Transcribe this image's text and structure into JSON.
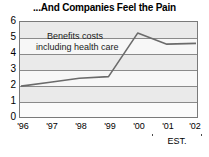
{
  "chart_data": {
    "type": "line",
    "title": "...And Companies Feel the Pain",
    "xlabel": "",
    "ylabel": "",
    "categories": [
      "'96",
      "'97",
      "'98",
      "'99",
      "'00",
      "'01",
      "'02"
    ],
    "series": [
      {
        "name": "Benefits costs including health care",
        "values": [
          1.95,
          2.2,
          2.45,
          2.55,
          5.3,
          4.6,
          4.65
        ]
      }
    ],
    "ylim": [
      0,
      6
    ],
    "yticks": [
      "0",
      "1",
      "2",
      "3",
      "4",
      "5",
      "6"
    ],
    "grid": true,
    "legend_position": "inside-top-left",
    "annotations": [
      {
        "name": "series-label-line-1",
        "text": "Benefits costs"
      },
      {
        "name": "series-label-line-2",
        "text": "including health care"
      },
      {
        "name": "estimate-bracket-label",
        "text": "EST."
      }
    ],
    "estimate_range": [
      "'01",
      "'02"
    ]
  },
  "colors": {
    "plot_background": "#f2f2f2",
    "band": "#eaeaea",
    "gridline": "#8a8a8a",
    "frame": "#7a7a7a",
    "line": "#6b6b6b",
    "text": "#000000",
    "page_background": "#ffffff"
  }
}
